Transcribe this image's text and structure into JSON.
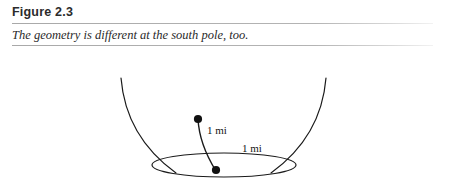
{
  "figure": {
    "number_label": "Figure 2.3",
    "caption": "The geometry is different at the south pole, too.",
    "rule_color": "#b0b0b0"
  },
  "diagram": {
    "name": "south-pole-funnel-geometry",
    "stroke_color": "#1a1a1a",
    "background_color": "#ffffff",
    "labels": {
      "radius_label": "1 mi",
      "circumference_label": "1 mi"
    },
    "points": [
      {
        "name": "upper-endpoint",
        "x": 198,
        "y": 64
      },
      {
        "name": "lower-endpoint",
        "x": 216,
        "y": 115
      }
    ]
  }
}
